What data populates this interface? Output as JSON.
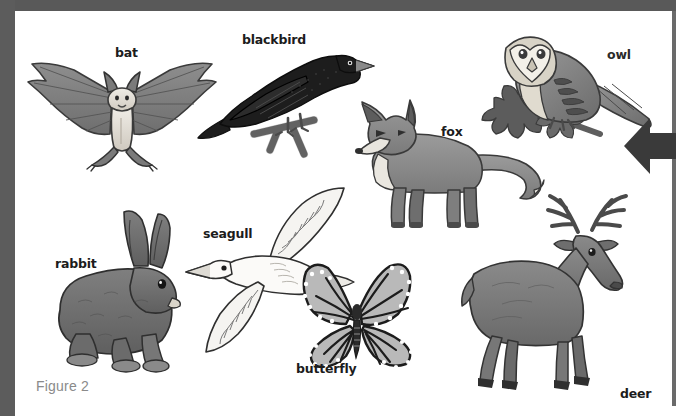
{
  "figure": {
    "caption": "Figure 2",
    "caption_color": "#8a8a8a",
    "background_color": "#ffffff",
    "frame_color": "#5c5c5c",
    "ink_color": "#1c1c1c"
  },
  "annotation": {
    "arrow": {
      "name": "left-pointing-arrow",
      "direction": "left",
      "color": "#3a3a3a"
    }
  },
  "labels": [
    {
      "id": "bat",
      "text": "bat",
      "x": 115,
      "y": 47,
      "weight": "bold"
    },
    {
      "id": "blackbird",
      "text": "blackbird",
      "x": 242,
      "y": 34,
      "weight": "bold"
    },
    {
      "id": "owl",
      "text": "owl",
      "x": 607,
      "y": 49,
      "weight": "thin"
    },
    {
      "id": "fox",
      "text": "fox",
      "x": 441,
      "y": 126,
      "weight": "bold"
    },
    {
      "id": "seagull",
      "text": "seagull",
      "x": 203,
      "y": 228,
      "weight": "bold"
    },
    {
      "id": "rabbit",
      "text": "rabbit",
      "x": 55,
      "y": 258,
      "weight": "bold"
    },
    {
      "id": "butterfly",
      "text": "butterfly",
      "x": 296,
      "y": 363,
      "weight": "bold"
    },
    {
      "id": "deer",
      "text": "deer",
      "x": 620,
      "y": 388,
      "weight": "bold"
    }
  ],
  "animals": [
    {
      "id": "bat",
      "common_name": "bat",
      "group": "mammal",
      "position": "top-left"
    },
    {
      "id": "blackbird",
      "common_name": "blackbird",
      "group": "bird",
      "position": "top-centre"
    },
    {
      "id": "owl",
      "common_name": "owl",
      "group": "bird",
      "position": "top-right"
    },
    {
      "id": "fox",
      "common_name": "fox",
      "group": "mammal",
      "position": "centre-right"
    },
    {
      "id": "seagull",
      "common_name": "seagull",
      "group": "bird",
      "position": "bottom-centre-left"
    },
    {
      "id": "rabbit",
      "common_name": "rabbit",
      "group": "mammal",
      "position": "bottom-left"
    },
    {
      "id": "butterfly",
      "common_name": "butterfly",
      "group": "insect",
      "position": "bottom-centre"
    },
    {
      "id": "deer",
      "common_name": "deer",
      "group": "mammal",
      "position": "bottom-right"
    }
  ]
}
